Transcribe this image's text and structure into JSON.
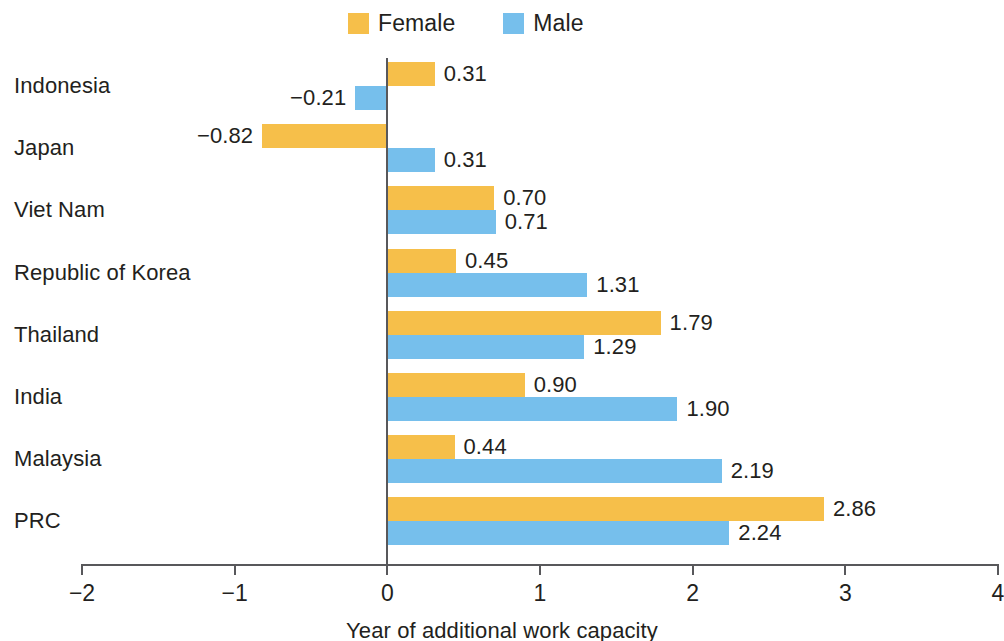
{
  "legend": {
    "items": [
      {
        "label": "Female",
        "color": "#f6bf4a",
        "key": "female"
      },
      {
        "label": "Male",
        "color": "#76bfec",
        "key": "male"
      }
    ]
  },
  "axis": {
    "title": "Year of additional work capacity",
    "ticks": [
      "-2",
      "-1",
      "0",
      "1",
      "2",
      "3",
      "4"
    ]
  },
  "chart_data": {
    "type": "bar",
    "orientation": "horizontal",
    "title": "",
    "subtitle": "",
    "xlabel": "Year of additional work capacity",
    "ylabel": "",
    "xlim": [
      -2,
      4
    ],
    "xticks": [
      -2,
      -1,
      0,
      1,
      2,
      3,
      4
    ],
    "grid": false,
    "legend_position": "top-center",
    "categories": [
      "Indonesia",
      "Japan",
      "Viet Nam",
      "Republic of Korea",
      "Thailand",
      "India",
      "Malaysia",
      "PRC"
    ],
    "series": [
      {
        "name": "Female",
        "color": "#f6bf4a",
        "values": [
          0.31,
          -0.82,
          0.7,
          0.45,
          1.79,
          0.9,
          0.44,
          2.86
        ],
        "labels": [
          "0.31",
          "-0.82",
          "0.70",
          "0.45",
          "1.79",
          "0.90",
          "0.44",
          "2.86"
        ]
      },
      {
        "name": "Male",
        "color": "#76bfec",
        "values": [
          -0.21,
          0.31,
          0.71,
          1.31,
          1.29,
          1.9,
          2.19,
          2.24
        ],
        "labels": [
          "-0.21",
          "0.31",
          "0.71",
          "1.31",
          "1.29",
          "1.90",
          "2.19",
          "2.24"
        ]
      }
    ]
  }
}
